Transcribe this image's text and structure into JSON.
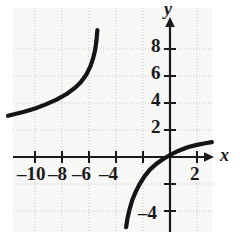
{
  "chart_data": {
    "type": "line",
    "title": "",
    "subtitle": "",
    "xlabel": "x",
    "ylabel": "y",
    "xlim": [
      -12.5,
      3.5
    ],
    "ylim": [
      -5.2,
      9.6
    ],
    "grid": true,
    "grid_spacing": 2,
    "legend": "none",
    "x_ticks": [
      -10,
      -8,
      -6,
      -4,
      -2,
      2
    ],
    "x_tick_labels": [
      "–10",
      "–8",
      "–6",
      "–4",
      "",
      "2"
    ],
    "y_ticks": [
      8,
      6,
      4,
      2,
      -2,
      -4
    ],
    "y_tick_labels": [
      "8",
      "6",
      "4",
      "2",
      "",
      "–4"
    ],
    "annotations": [],
    "series": [
      {
        "name": "left-branch",
        "comment": "logarithmic branch left of vertical asymptote near x = -5, increasing steeply upward",
        "x": [
          -12.0,
          -11.4,
          -10.8,
          -10.0,
          -9.2,
          -8.4,
          -7.6,
          -7.0,
          -6.6,
          -6.2,
          -5.9,
          -5.7,
          -5.55,
          -5.45,
          -5.38
        ],
        "y": [
          3.05,
          3.2,
          3.35,
          3.6,
          3.9,
          4.25,
          4.7,
          5.15,
          5.55,
          6.1,
          6.7,
          7.3,
          7.9,
          8.6,
          9.4
        ]
      },
      {
        "name": "right-branch",
        "comment": "logarithmic branch right of vertical asymptote near x = -3.3, rising and flattening, crosses x-axis near x = -0.2",
        "x": [
          -3.25,
          -3.15,
          -3.0,
          -2.8,
          -2.55,
          -2.25,
          -1.9,
          -1.5,
          -1.0,
          -0.5,
          0.0,
          0.6,
          1.3,
          2.0,
          2.6,
          3.1
        ],
        "y": [
          -5.2,
          -4.55,
          -3.9,
          -3.2,
          -2.6,
          -2.0,
          -1.45,
          -0.95,
          -0.5,
          -0.15,
          0.15,
          0.45,
          0.72,
          0.9,
          1.02,
          1.1
        ]
      }
    ]
  },
  "axes": {
    "x_axis_name": "x",
    "y_axis_name": "y"
  }
}
